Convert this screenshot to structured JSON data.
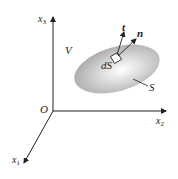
{
  "figure": {
    "type": "3d-coordinate-diagram",
    "axes": {
      "x1": {
        "base": "x",
        "sub": "1"
      },
      "x2": {
        "base": "x",
        "sub": "2"
      },
      "x3": {
        "base": "x",
        "sub": "3"
      },
      "origin": "O"
    },
    "labels": {
      "volume": "V",
      "surface": "S",
      "surface_element": "dS",
      "traction_vector": "t",
      "normal_vector": "n"
    },
    "colors": {
      "line": "#222222",
      "surface_center": "#ffffff",
      "surface_edge": "#a8a8a8"
    }
  }
}
